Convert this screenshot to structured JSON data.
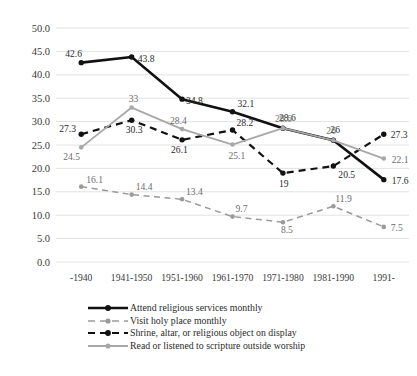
{
  "chart_data": {
    "type": "line",
    "title": "",
    "subtitle": "",
    "xlabel": "",
    "ylabel": "",
    "categories": [
      "-1940",
      "1941-1950",
      "1951-1960",
      "1961-1970",
      "1971-1980",
      "1981-1990",
      "1991-"
    ],
    "ylim": [
      0.0,
      50.0
    ],
    "ytick_step": 5.0,
    "ytick_labels": [
      "0.0",
      "5.0",
      "10.0",
      "15.0",
      "20.0",
      "25.0",
      "30.0",
      "35.0",
      "40.0",
      "45.0",
      "50.0"
    ],
    "grid": "horizontal",
    "legend_position": "bottom-left",
    "series": [
      {
        "name": "Attend religious services monthly",
        "style": "solid",
        "color": "#111111",
        "width": 2.6,
        "values": [
          42.6,
          43.8,
          34.8,
          32.1,
          28.6,
          26,
          17.6
        ],
        "labels": [
          "42.6",
          "43.8",
          "34.8",
          "32.1",
          "28.6",
          "26",
          "17.6"
        ]
      },
      {
        "name": "Visit holy place monthly",
        "style": "dashed",
        "color": "#9a9a9a",
        "width": 1.5,
        "values": [
          16.1,
          14.4,
          13.4,
          9.7,
          8.5,
          11.9,
          7.5
        ],
        "labels": [
          "16.1",
          "14.4",
          "13.4",
          "9.7",
          "8.5",
          "11.9",
          "7.5"
        ]
      },
      {
        "name": "Shrine, altar, or religious object on display",
        "style": "dashed",
        "color": "#111111",
        "width": 2.2,
        "values": [
          27.3,
          30.3,
          26.1,
          28.2,
          19,
          20.5,
          27.3
        ],
        "labels": [
          "27.3",
          "30.3",
          "26.1",
          "28.2",
          "19",
          "20.5",
          "27.3"
        ]
      },
      {
        "name": "Read or listened to scripture outside worship",
        "style": "solid",
        "color": "#a8a8a8",
        "width": 1.8,
        "values": [
          24.5,
          33,
          28.4,
          25.1,
          28.6,
          26,
          22.1
        ],
        "labels": [
          "24.5",
          "33",
          "28.4",
          "25.1",
          "28.6",
          "26",
          "22.1"
        ]
      }
    ]
  },
  "legend": {
    "items": [
      {
        "label": "Attend religious services monthly"
      },
      {
        "label": "Visit holy place monthly"
      },
      {
        "label": "Shrine, altar, or religious object on display"
      },
      {
        "label": "Read or listened to scripture outside worship"
      }
    ]
  },
  "caption": {
    "text": ""
  }
}
